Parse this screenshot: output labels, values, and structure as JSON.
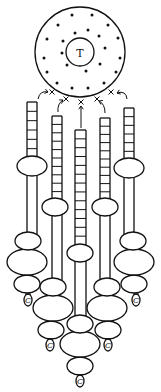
{
  "diagram": {
    "width": 161,
    "height": 392,
    "colors": {
      "ink": "#111111",
      "paper": "#ffffff"
    },
    "center_circle": {
      "cx": 80,
      "cy": 52,
      "r": 45,
      "inner": {
        "cx": 80,
        "cy": 52,
        "r": 14,
        "label": "T"
      },
      "dots": [
        [
          72,
          15
        ],
        [
          92,
          15
        ],
        [
          58,
          25
        ],
        [
          108,
          25
        ],
        [
          47,
          39
        ],
        [
          118,
          38
        ],
        [
          44,
          58
        ],
        [
          120,
          58
        ],
        [
          47,
          72
        ],
        [
          116,
          72
        ],
        [
          57,
          83
        ],
        [
          72,
          88
        ],
        [
          88,
          88
        ],
        [
          104,
          83
        ],
        [
          75,
          33
        ],
        [
          88,
          30
        ],
        [
          63,
          41
        ],
        [
          99,
          36
        ],
        [
          62,
          53
        ],
        [
          105,
          48
        ],
        [
          67,
          65
        ],
        [
          100,
          64
        ],
        [
          86,
          71
        ]
      ]
    },
    "crosses": [
      [
        52,
        92
      ],
      [
        66,
        99
      ],
      [
        81,
        102
      ],
      [
        97,
        99
      ],
      [
        111,
        92
      ]
    ],
    "arrows": [
      {
        "from": [
          38,
          99
        ],
        "ctrl": [
          40,
          90
        ],
        "to": [
          48,
          92
        ]
      },
      {
        "from": [
          58,
          112
        ],
        "ctrl": [
          57,
          104
        ],
        "to": [
          63,
          100
        ]
      },
      {
        "from": [
          81,
          128
        ],
        "ctrl": [
          81,
          115
        ],
        "to": [
          81,
          106
        ]
      },
      {
        "from": [
          105,
          113
        ],
        "ctrl": [
          105,
          104
        ],
        "to": [
          99,
          101
        ]
      },
      {
        "from": [
          127,
          99
        ],
        "ctrl": [
          126,
          90
        ],
        "to": [
          117,
          93
        ]
      }
    ],
    "columns": [
      {
        "id": "col-1",
        "x": 27,
        "w": 10,
        "top": 102,
        "ladder_bottom": 158,
        "rungs": 6,
        "upper_bead": {
          "cx": 32,
          "cy": 166,
          "rx": 15,
          "ry": 10
        },
        "stalk_bottom": 234,
        "beads": [
          {
            "cx": 28,
            "cy": 241,
            "rx": 13,
            "ry": 9
          },
          {
            "cx": 27,
            "cy": 262,
            "rx": 20,
            "ry": 13
          },
          {
            "cx": 27,
            "cy": 284,
            "rx": 13,
            "ry": 9
          }
        ],
        "pendant": {
          "cx": 28,
          "cy": 300,
          "label": "C"
        }
      },
      {
        "id": "col-2",
        "x": 52,
        "w": 10,
        "top": 116,
        "ladder_bottom": 200,
        "rungs": 10,
        "upper_bead": {
          "cx": 55,
          "cy": 207,
          "rx": 13,
          "ry": 9
        },
        "stalk_bottom": 280,
        "beads": [
          {
            "cx": 53,
            "cy": 287,
            "rx": 13,
            "ry": 9
          },
          {
            "cx": 53,
            "cy": 308,
            "rx": 20,
            "ry": 13
          },
          {
            "cx": 51,
            "cy": 330,
            "rx": 13,
            "ry": 9
          }
        ],
        "pendant": {
          "cx": 50,
          "cy": 345,
          "label": "C"
        }
      },
      {
        "id": "col-3",
        "x": 75,
        "w": 11,
        "top": 130,
        "ladder_bottom": 245,
        "rungs": 13,
        "upper_bead": {
          "cx": 80,
          "cy": 253,
          "rx": 13,
          "ry": 9
        },
        "stalk_bottom": 317,
        "beads": [
          {
            "cx": 80,
            "cy": 324,
            "rx": 13,
            "ry": 9
          },
          {
            "cx": 80,
            "cy": 344,
            "rx": 20,
            "ry": 13
          },
          {
            "cx": 80,
            "cy": 366,
            "rx": 13,
            "ry": 9
          }
        ],
        "pendant": {
          "cx": 80,
          "cy": 381,
          "label": "C"
        }
      },
      {
        "id": "col-4",
        "x": 100,
        "w": 10,
        "top": 118,
        "ladder_bottom": 200,
        "rungs": 10,
        "upper_bead": {
          "cx": 105,
          "cy": 207,
          "rx": 13,
          "ry": 9
        },
        "stalk_bottom": 280,
        "beads": [
          {
            "cx": 107,
            "cy": 287,
            "rx": 13,
            "ry": 9
          },
          {
            "cx": 107,
            "cy": 308,
            "rx": 20,
            "ry": 13
          },
          {
            "cx": 108,
            "cy": 330,
            "rx": 13,
            "ry": 9
          }
        ],
        "pendant": {
          "cx": 108,
          "cy": 345,
          "label": "C"
        }
      },
      {
        "id": "col-5",
        "x": 124,
        "w": 10,
        "top": 108,
        "ladder_bottom": 160,
        "rungs": 6,
        "upper_bead": {
          "cx": 129,
          "cy": 168,
          "rx": 15,
          "ry": 10
        },
        "stalk_bottom": 234,
        "beads": [
          {
            "cx": 133,
            "cy": 241,
            "rx": 13,
            "ry": 9
          },
          {
            "cx": 134,
            "cy": 262,
            "rx": 20,
            "ry": 13
          },
          {
            "cx": 134,
            "cy": 284,
            "rx": 13,
            "ry": 9
          }
        ],
        "pendant": {
          "cx": 136,
          "cy": 300,
          "label": "C"
        }
      }
    ]
  }
}
